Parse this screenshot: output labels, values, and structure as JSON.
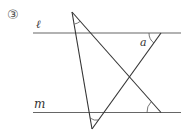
{
  "problem_number": "③",
  "labels": {
    "line_l": "ℓ",
    "line_m": "m",
    "angle": "a"
  },
  "colors": {
    "line": "#555555",
    "text": "#333333"
  }
}
